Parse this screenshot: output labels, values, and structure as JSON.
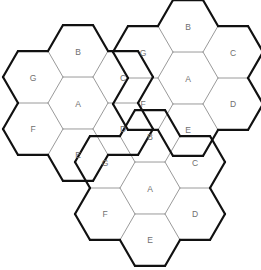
{
  "diagram": {
    "background_color": "#ffffff",
    "inner_edge_color": "#9a9a9a",
    "outer_edge_color": "#111111",
    "label_color": "#6f6f6f",
    "hex_radius": 30,
    "orientation": "flat-top",
    "cluster_count": 3,
    "hexes_per_cluster": 7,
    "cell_labels": [
      "A",
      "B",
      "C",
      "D",
      "E",
      "F",
      "G"
    ],
    "cell_offsets": {
      "A": [
        0,
        0
      ],
      "B": [
        0,
        -1
      ],
      "C": [
        1,
        -1
      ],
      "D": [
        1,
        0
      ],
      "E": [
        0,
        1
      ],
      "F": [
        -1,
        0
      ],
      "G": [
        -1,
        -1
      ]
    },
    "clusters": [
      {
        "name": "left-cluster",
        "center_x": 78,
        "center_y": 103,
        "cells": [
          {
            "label": "A",
            "q": 0,
            "r": 0
          },
          {
            "label": "B",
            "q": 0,
            "r": -1
          },
          {
            "label": "C",
            "q": 1,
            "r": -1
          },
          {
            "label": "D",
            "q": 1,
            "r": 0
          },
          {
            "label": "E",
            "q": 0,
            "r": 1
          },
          {
            "label": "F",
            "q": -1,
            "r": 0
          },
          {
            "label": "G",
            "q": -1,
            "r": -1
          }
        ]
      },
      {
        "name": "right-cluster",
        "center_x": 188,
        "center_y": 78,
        "cells": [
          {
            "label": "A",
            "q": 0,
            "r": 0
          },
          {
            "label": "B",
            "q": 0,
            "r": -1
          },
          {
            "label": "C",
            "q": 1,
            "r": -1
          },
          {
            "label": "D",
            "q": 1,
            "r": 0
          },
          {
            "label": "E",
            "q": 0,
            "r": 1
          },
          {
            "label": "F",
            "q": -1,
            "r": 0
          },
          {
            "label": "G",
            "q": -1,
            "r": -1
          }
        ]
      },
      {
        "name": "bottom-cluster",
        "center_x": 150,
        "center_y": 188,
        "cells": [
          {
            "label": "A",
            "q": 0,
            "r": 0
          },
          {
            "label": "B",
            "q": 0,
            "r": -1
          },
          {
            "label": "C",
            "q": 1,
            "r": -1
          },
          {
            "label": "D",
            "q": 1,
            "r": 0
          },
          {
            "label": "E",
            "q": 0,
            "r": 1
          },
          {
            "label": "F",
            "q": -1,
            "r": 0
          },
          {
            "label": "G",
            "q": -1,
            "r": -1
          }
        ]
      }
    ]
  }
}
